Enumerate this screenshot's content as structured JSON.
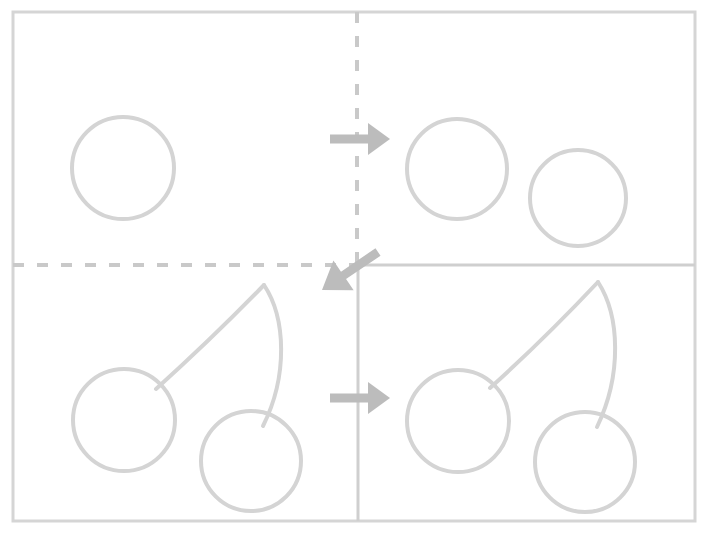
{
  "canvas": {
    "width": 709,
    "height": 535,
    "background": "#ffffff",
    "title": "Cherry drawing tutorial - four step panels"
  },
  "palette": {
    "stroke": "#d4d4d4",
    "stroke_light": "#d8d8d8",
    "arrow": "#bcbcbc",
    "divider_solid": "#cfcfcf",
    "divider_dashed": "#c9c9c9",
    "frame": "#d5d5d5"
  },
  "frame": {
    "name": "outer-frame",
    "x": 13,
    "y": 12,
    "width": 682,
    "height": 509,
    "stroke_width": 3
  },
  "dividers": [
    {
      "name": "divider-vertical-dashed-top",
      "orientation": "vertical",
      "style": "dashed",
      "x": 357,
      "y1": 12,
      "y2": 265,
      "dash": "11 13",
      "stroke_width": 4
    },
    {
      "name": "divider-horizontal-dashed-left",
      "orientation": "horizontal",
      "style": "dashed",
      "y": 265,
      "x1": 13,
      "x2": 357,
      "dash": "11 13",
      "stroke_width": 4
    },
    {
      "name": "divider-horizontal-solid-right",
      "orientation": "horizontal",
      "style": "solid",
      "y": 265,
      "x1": 357,
      "x2": 695,
      "stroke_width": 3
    },
    {
      "name": "divider-vertical-solid-bottom",
      "orientation": "vertical",
      "style": "solid",
      "x": 358,
      "y1": 265,
      "y2": 521,
      "stroke_width": 3
    }
  ],
  "arrows": [
    {
      "name": "arrow-step1-to-step2",
      "direction": "right",
      "label": "step 1 to step 2",
      "tail_x": 330,
      "tip_x": 390,
      "y": 139,
      "shaft_thickness": 9,
      "head_length": 22,
      "head_half_width": 16
    },
    {
      "name": "arrow-step2-to-step3",
      "direction": "down-left",
      "label": "step 2 to step 3",
      "tail_x": 378,
      "tail_y": 252,
      "tip_x": 322,
      "tip_y": 290,
      "shaft_thickness": 9,
      "head_length": 26,
      "head_half_width": 18
    },
    {
      "name": "arrow-step3-to-step4",
      "direction": "right",
      "label": "step 3 to step 4",
      "tail_x": 330,
      "tip_x": 390,
      "y": 398,
      "shaft_thickness": 9,
      "head_length": 22,
      "head_half_width": 16
    }
  ],
  "panels": [
    {
      "name": "panel-step-1",
      "step": 1,
      "position": "top-left",
      "description": "One empty circle - first cherry outline",
      "circles": [
        {
          "name": "cherry-circle-1",
          "cx": 123,
          "cy": 168,
          "r": 51,
          "stroke_width": 4
        }
      ],
      "stems": []
    },
    {
      "name": "panel-step-2",
      "step": 2,
      "position": "top-right",
      "description": "Two circles - both cherry outlines",
      "circles": [
        {
          "name": "cherry-circle-1",
          "cx": 457,
          "cy": 169,
          "r": 50,
          "stroke_width": 4
        },
        {
          "name": "cherry-circle-2",
          "cx": 578,
          "cy": 198,
          "r": 48,
          "stroke_width": 4
        }
      ],
      "stems": []
    },
    {
      "name": "panel-step-3",
      "step": 3,
      "position": "bottom-left",
      "description": "Two circles joined by a pointed double-curve stem",
      "circles": [
        {
          "name": "cherry-circle-1",
          "cx": 124,
          "cy": 420,
          "r": 51,
          "stroke_width": 4
        },
        {
          "name": "cherry-circle-2",
          "cx": 251,
          "cy": 461,
          "r": 50,
          "stroke_width": 4
        }
      ],
      "stems": [
        {
          "name": "cherry-stem-left",
          "path": "M 264 285 C 232 318 196 353 156 389",
          "stroke_width": 4
        },
        {
          "name": "cherry-stem-right",
          "path": "M 264 285 C 286 318 288 376 263 426",
          "stroke_width": 4
        }
      ]
    },
    {
      "name": "panel-step-4",
      "step": 4,
      "position": "bottom-right",
      "description": "Finished cherry pair - two circles with pointed stem",
      "circles": [
        {
          "name": "cherry-circle-1",
          "cx": 458,
          "cy": 421,
          "r": 51,
          "stroke_width": 4
        },
        {
          "name": "cherry-circle-2",
          "cx": 585,
          "cy": 462,
          "r": 50,
          "stroke_width": 4
        }
      ],
      "stems": [
        {
          "name": "cherry-stem-left",
          "path": "M 598 282 C 566 316 530 352 490 388",
          "stroke_width": 4
        },
        {
          "name": "cherry-stem-right",
          "path": "M 598 282 C 620 316 622 375 597 427",
          "stroke_width": 4
        }
      ]
    }
  ]
}
